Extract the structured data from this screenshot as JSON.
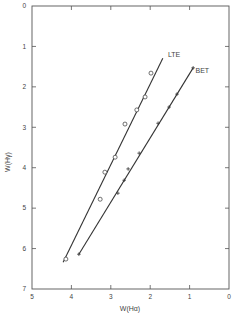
{
  "chart_data": {
    "type": "scatter",
    "title": "",
    "xlabel": "W(Hα)",
    "ylabel": "W(Hγ)",
    "xlim": [
      5,
      0
    ],
    "ylim": [
      7,
      0
    ],
    "x_reversed": true,
    "y_reversed": true,
    "x_ticks": [
      5,
      4,
      3,
      2,
      1,
      0
    ],
    "y_ticks": [
      0,
      1,
      2,
      3,
      4,
      5,
      6,
      7
    ],
    "grid": false,
    "series": [
      {
        "name": "LTE",
        "marker": "circle",
        "points": [
          {
            "x": 1.98,
            "y": 1.66
          },
          {
            "x": 2.13,
            "y": 2.25
          },
          {
            "x": 2.34,
            "y": 2.57
          },
          {
            "x": 2.64,
            "y": 2.92
          },
          {
            "x": 2.89,
            "y": 3.74
          },
          {
            "x": 3.15,
            "y": 4.11
          },
          {
            "x": 3.27,
            "y": 4.78
          },
          {
            "x": 4.14,
            "y": 6.26
          }
        ],
        "fit_line": [
          {
            "x": 1.68,
            "y": 1.29
          },
          {
            "x": 4.21,
            "y": 6.34
          }
        ],
        "label_pos": {
          "x": 1.55,
          "y": 1.2
        }
      },
      {
        "name": "BET",
        "marker": "cross",
        "points": [
          {
            "x": 0.91,
            "y": 1.53
          },
          {
            "x": 1.32,
            "y": 2.18
          },
          {
            "x": 1.52,
            "y": 2.5
          },
          {
            "x": 1.8,
            "y": 2.9
          },
          {
            "x": 2.28,
            "y": 3.64
          },
          {
            "x": 2.56,
            "y": 4.03
          },
          {
            "x": 2.66,
            "y": 4.31
          },
          {
            "x": 2.82,
            "y": 4.63
          },
          {
            "x": 3.81,
            "y": 6.14
          }
        ],
        "fit_line": [
          {
            "x": 0.91,
            "y": 1.53
          },
          {
            "x": 3.81,
            "y": 6.14
          }
        ],
        "label_pos": {
          "x": 0.85,
          "y": 1.6
        }
      }
    ]
  },
  "colors": {
    "ink": "#333333",
    "axis": "#555555",
    "background": "#ffffff"
  }
}
